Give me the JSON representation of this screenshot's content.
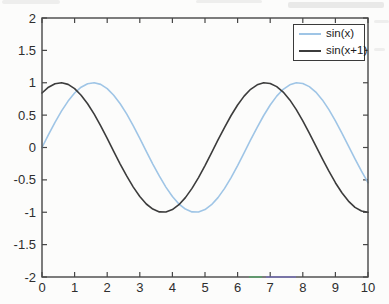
{
  "chart_data": {
    "type": "line",
    "title": "",
    "xlabel": "",
    "ylabel": "",
    "xlim": [
      0,
      10
    ],
    "ylim": [
      -2,
      2
    ],
    "x_ticks": [
      0,
      1,
      2,
      3,
      4,
      5,
      6,
      7,
      8,
      9,
      10
    ],
    "y_ticks": [
      -2,
      -1.5,
      -1,
      -0.5,
      0,
      0.5,
      1,
      1.5,
      2
    ],
    "grid": false,
    "legend_position": "top-right",
    "axis_color": "#474747",
    "tick_label_color": "#2e2e2e",
    "x": [
      0,
      0.2,
      0.4,
      0.6,
      0.8,
      1,
      1.2,
      1.4,
      1.6,
      1.8,
      2,
      2.2,
      2.4,
      2.6,
      2.8,
      3,
      3.2,
      3.4,
      3.6,
      3.8,
      4,
      4.2,
      4.4,
      4.6,
      4.8,
      5,
      5.2,
      5.4,
      5.6,
      5.8,
      6,
      6.2,
      6.4,
      6.6,
      6.8,
      7,
      7.2,
      7.4,
      7.6,
      7.8,
      8,
      8.2,
      8.4,
      8.6,
      8.8,
      9,
      9.2,
      9.4,
      9.6,
      9.8,
      10
    ],
    "series": [
      {
        "name": "sin(x)",
        "color": "#9fc5e6",
        "values": [
          0.0,
          0.199,
          0.389,
          0.565,
          0.717,
          0.841,
          0.932,
          0.985,
          1.0,
          0.974,
          0.909,
          0.808,
          0.675,
          0.516,
          0.335,
          0.141,
          -0.058,
          -0.256,
          -0.443,
          -0.612,
          -0.757,
          -0.872,
          -0.952,
          -0.994,
          -0.996,
          -0.959,
          -0.883,
          -0.773,
          -0.631,
          -0.465,
          -0.279,
          -0.083,
          0.117,
          0.312,
          0.494,
          0.657,
          0.794,
          0.899,
          0.968,
          0.999,
          0.989,
          0.941,
          0.855,
          0.735,
          0.586,
          0.412,
          0.223,
          0.025,
          -0.174,
          -0.366,
          -0.544
        ]
      },
      {
        "name": "sin(x+1)",
        "color": "#3c3c3c",
        "values": [
          0.841,
          0.932,
          0.985,
          1.0,
          0.974,
          0.909,
          0.808,
          0.675,
          0.516,
          0.335,
          0.141,
          -0.058,
          -0.256,
          -0.443,
          -0.612,
          -0.757,
          -0.872,
          -0.952,
          -0.994,
          -0.996,
          -0.959,
          -0.883,
          -0.773,
          -0.631,
          -0.465,
          -0.279,
          -0.083,
          0.117,
          0.312,
          0.494,
          0.657,
          0.794,
          0.899,
          0.968,
          0.999,
          0.989,
          0.941,
          0.855,
          0.735,
          0.586,
          0.412,
          0.223,
          0.025,
          -0.174,
          -0.366,
          -0.544,
          -0.7,
          -0.828,
          -0.925,
          -0.981,
          -1.0
        ]
      }
    ]
  }
}
